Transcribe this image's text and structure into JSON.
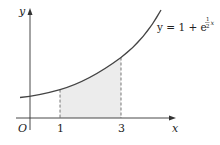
{
  "figure": {
    "axes": {
      "x_label": "x",
      "y_label": "y",
      "origin_label": "O"
    },
    "ticks": {
      "x1": "1",
      "x3": "3"
    },
    "curve_label": {
      "lhs": "y = 1 + e",
      "exp_num": "1",
      "exp_den": "2",
      "exp_var": "x"
    },
    "shaded_region": {
      "from": 1,
      "to": 3,
      "fill": "#ececec"
    },
    "colors": {
      "curve": "#444444",
      "axes": "#333333",
      "dashes": "#555555"
    }
  }
}
